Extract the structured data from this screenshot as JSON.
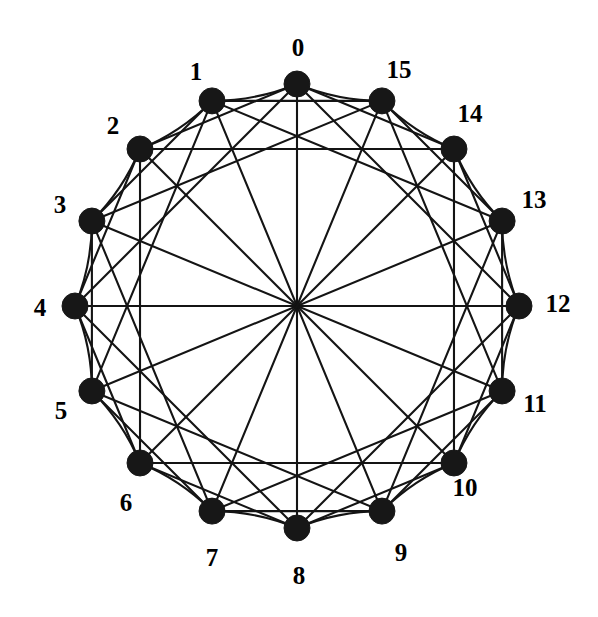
{
  "figure": {
    "background_color": "#ffffff",
    "ink_color": "#141414",
    "node_color": "#171717",
    "label_color": "#000000"
  },
  "chart_data": {
    "type": "diagram",
    "graph_type": "circulant",
    "node_count": 16,
    "connection_set": [
      1,
      2,
      4,
      8
    ],
    "degree_per_node": 7,
    "edge_count": 56,
    "layout": {
      "arrangement": "circular",
      "center_x": 297,
      "center_y": 306,
      "radius": 222,
      "start_angle_deg": -90,
      "direction": "counterclockwise",
      "node_radius": 13,
      "label_offset": 35
    },
    "nodes": [
      {
        "id": 0,
        "label": "0",
        "angle_deg": -90,
        "label_x": 298,
        "label_y": 50
      },
      {
        "id": 1,
        "label": "1",
        "angle_deg": -112.5,
        "label_x": 196,
        "label_y": 74
      },
      {
        "id": 2,
        "label": "2",
        "angle_deg": -135,
        "label_x": 113,
        "label_y": 128
      },
      {
        "id": 3,
        "label": "3",
        "angle_deg": -157.5,
        "label_x": 60,
        "label_y": 207
      },
      {
        "id": 4,
        "label": "4",
        "angle_deg": 180,
        "label_x": 40,
        "label_y": 310
      },
      {
        "id": 5,
        "label": "5",
        "angle_deg": 157.5,
        "label_x": 61,
        "label_y": 413
      },
      {
        "id": 6,
        "label": "6",
        "angle_deg": 135,
        "label_x": 126,
        "label_y": 505
      },
      {
        "id": 7,
        "label": "7",
        "angle_deg": 112.5,
        "label_x": 212,
        "label_y": 560
      },
      {
        "id": 8,
        "label": "8",
        "angle_deg": 90,
        "label_x": 299,
        "label_y": 578
      },
      {
        "id": 9,
        "label": "9",
        "angle_deg": 67.5,
        "label_x": 401,
        "label_y": 555
      },
      {
        "id": 10,
        "label": "10",
        "angle_deg": 45,
        "label_x": 465,
        "label_y": 490
      },
      {
        "id": 11,
        "label": "11",
        "angle_deg": 22.5,
        "label_x": 535,
        "label_y": 406
      },
      {
        "id": 12,
        "label": "12",
        "angle_deg": 0,
        "label_x": 558,
        "label_y": 306
      },
      {
        "id": 13,
        "label": "13",
        "angle_deg": -22.5,
        "label_x": 534,
        "label_y": 202
      },
      {
        "id": 14,
        "label": "14",
        "angle_deg": -45,
        "label_x": 470,
        "label_y": 116
      },
      {
        "id": 15,
        "label": "15",
        "angle_deg": -67.5,
        "label_x": 399,
        "label_y": 72
      }
    ],
    "edges_by_distance": {
      "1": [
        [
          0,
          1
        ],
        [
          1,
          2
        ],
        [
          2,
          3
        ],
        [
          3,
          4
        ],
        [
          4,
          5
        ],
        [
          5,
          6
        ],
        [
          6,
          7
        ],
        [
          7,
          8
        ],
        [
          8,
          9
        ],
        [
          9,
          10
        ],
        [
          10,
          11
        ],
        [
          11,
          12
        ],
        [
          12,
          13
        ],
        [
          13,
          14
        ],
        [
          14,
          15
        ],
        [
          15,
          0
        ]
      ],
      "2": [
        [
          0,
          2
        ],
        [
          1,
          3
        ],
        [
          2,
          4
        ],
        [
          3,
          5
        ],
        [
          4,
          6
        ],
        [
          5,
          7
        ],
        [
          6,
          8
        ],
        [
          7,
          9
        ],
        [
          8,
          10
        ],
        [
          9,
          11
        ],
        [
          10,
          12
        ],
        [
          11,
          13
        ],
        [
          12,
          14
        ],
        [
          13,
          15
        ],
        [
          14,
          0
        ],
        [
          15,
          1
        ]
      ],
      "4": [
        [
          0,
          4
        ],
        [
          1,
          5
        ],
        [
          2,
          6
        ],
        [
          3,
          7
        ],
        [
          4,
          8
        ],
        [
          5,
          9
        ],
        [
          6,
          10
        ],
        [
          7,
          11
        ],
        [
          8,
          12
        ],
        [
          9,
          13
        ],
        [
          10,
          14
        ],
        [
          11,
          15
        ],
        [
          12,
          0
        ],
        [
          13,
          1
        ],
        [
          14,
          2
        ],
        [
          15,
          3
        ]
      ],
      "8": [
        [
          0,
          8
        ],
        [
          1,
          9
        ],
        [
          2,
          10
        ],
        [
          3,
          11
        ],
        [
          4,
          12
        ],
        [
          5,
          13
        ],
        [
          6,
          14
        ],
        [
          7,
          15
        ]
      ]
    }
  }
}
